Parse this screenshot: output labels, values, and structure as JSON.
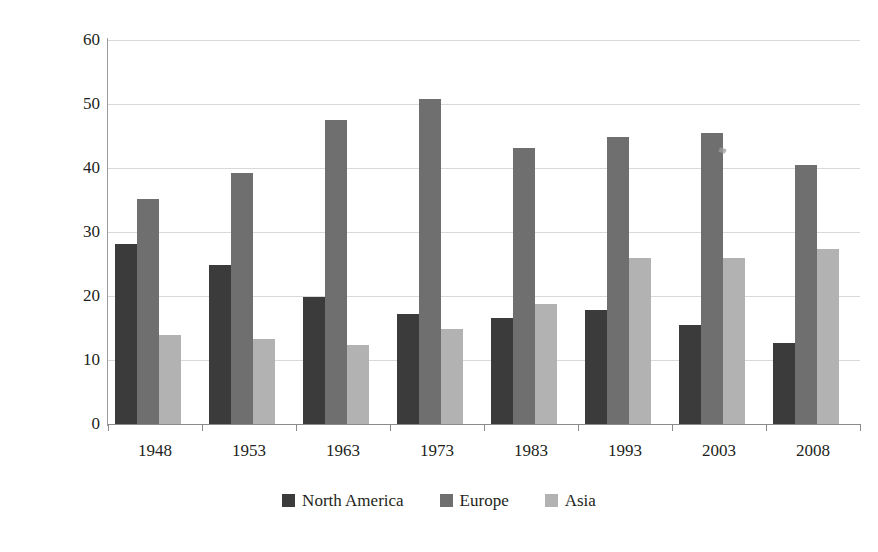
{
  "chart_data": {
    "type": "bar",
    "title": "",
    "subtitle": "",
    "xlabel": "",
    "ylabel": "Percentages of total",
    "ylim": [
      0,
      60
    ],
    "yticks": [
      0,
      10,
      20,
      30,
      40,
      50,
      60
    ],
    "grid": true,
    "legend_position": "bottom",
    "categories": [
      "1948",
      "1953",
      "1963",
      "1973",
      "1983",
      "1993",
      "2003",
      "2008"
    ],
    "series": [
      {
        "name": "North America",
        "color": "#3b3b3b",
        "values": [
          28.2,
          24.9,
          19.9,
          17.2,
          16.5,
          17.8,
          15.4,
          12.7
        ]
      },
      {
        "name": "Europe",
        "color": "#6f6f6f",
        "values": [
          35.1,
          39.2,
          47.5,
          50.8,
          43.2,
          44.9,
          45.4,
          40.5
        ]
      },
      {
        "name": "Asia",
        "color": "#b2b2b2",
        "values": [
          13.9,
          13.3,
          12.4,
          14.8,
          18.8,
          25.9,
          25.9,
          27.3
        ]
      }
    ]
  },
  "legend": {
    "items": [
      {
        "label": "North America",
        "swatch_class": "na"
      },
      {
        "label": "Europe",
        "swatch_class": "eu"
      },
      {
        "label": "Asia",
        "swatch_class": "asia"
      }
    ]
  }
}
